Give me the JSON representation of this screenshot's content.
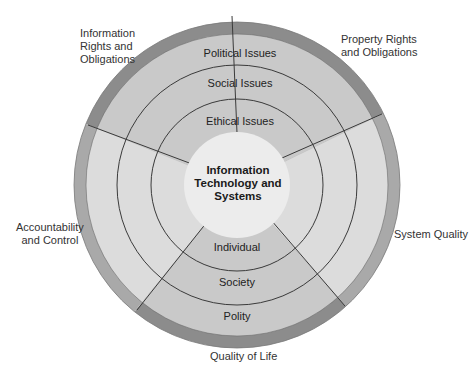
{
  "center": {
    "lines": [
      "Information",
      "Technology and",
      "Systems"
    ]
  },
  "upper_rings": {
    "political": "Political Issues",
    "social": "Social Issues",
    "ethical": "Ethical Issues"
  },
  "lower_rings": {
    "individual": "Individual",
    "society": "Society",
    "polity": "Polity"
  },
  "dimensions": {
    "info_rights": [
      "Information",
      "Rights and",
      "Obligations"
    ],
    "property_rights": [
      "Property Rights",
      "and Obligations"
    ],
    "accountability": [
      "Accountability",
      "and Control"
    ],
    "system_quality": "System Quality",
    "quality_of_life": "Quality of Life"
  },
  "colors": {
    "outer_ring_dark": "#8c8c8c",
    "outer_ring_light": "#a9a9a9",
    "band_dark": "#c9c9c9",
    "band_light": "#dcdcdc",
    "center_disc": "#ececec",
    "line": "#3a3a3a"
  }
}
